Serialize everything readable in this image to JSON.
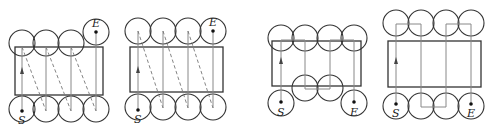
{
  "figure": {
    "panels": [
      {
        "id": "a",
        "start_label": "S",
        "end_label": "E",
        "top_circles": 3,
        "bottom_circles": 4,
        "end_circle": "separate top-right",
        "return_paths": "dashed diagonal"
      },
      {
        "id": "b",
        "start_label": "S",
        "end_label": "E",
        "top_circles": 4,
        "bottom_circles": 4,
        "end_circle": "top-right of top row",
        "return_paths": "dashed diagonal"
      },
      {
        "id": "c",
        "start_label": "S",
        "end_label": "E",
        "top_circles": 4,
        "bottom_circles": 2,
        "end_circle": "separate bottom-right",
        "return_paths": "boustrophedon solid"
      },
      {
        "id": "d",
        "start_label": "S",
        "end_label": "E",
        "top_circles": 4,
        "bottom_circles": 4,
        "end_circle": "bottom-right of bottom row",
        "return_paths": "boustrophedon solid"
      }
    ]
  },
  "colors": {
    "stroke": "#333333",
    "path": "#888888",
    "background": "#ffffff"
  }
}
